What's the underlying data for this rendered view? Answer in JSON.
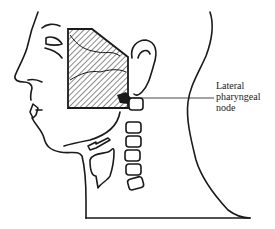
{
  "figure": {
    "colors": {
      "ink": "#1a1a1a",
      "background": "#ffffff"
    },
    "annotations": [
      {
        "id": "lateral-pharyngeal-node",
        "lines": [
          "Lateral",
          "pharyngeal",
          "node"
        ]
      }
    ]
  }
}
